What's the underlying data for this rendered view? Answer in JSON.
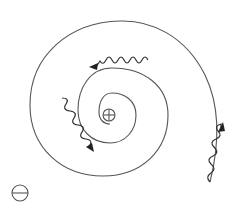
{
  "diagram": {
    "type": "classical-atom-spiral",
    "nucleus": {
      "symbol": "+",
      "label": "positive-charge",
      "cx": 109,
      "cy": 115,
      "r": 6
    },
    "electron_marker": {
      "symbol": "−",
      "label": "negative-charge",
      "cx": 20,
      "cy": 193,
      "r": 8
    },
    "trajectory": {
      "kind": "inward-spiral",
      "turns": 2.5
    },
    "photons": [
      {
        "id": "photon-top",
        "direction": "left",
        "from": [
          148,
          62
        ],
        "to": [
          90,
          67
        ]
      },
      {
        "id": "photon-left",
        "direction": "down-right",
        "from": [
          62,
          98
        ],
        "to": [
          93,
          150
        ]
      },
      {
        "id": "photon-right",
        "direction": "up",
        "from": [
          210,
          182
        ],
        "to": [
          222,
          123
        ]
      }
    ],
    "colors": {
      "line": "#555555",
      "wave": "#333333",
      "arrowhead": "#222222",
      "background": "#ffffff"
    }
  }
}
